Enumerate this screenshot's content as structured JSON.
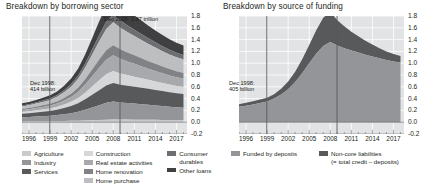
{
  "left": {
    "title": "Breakdown by borrowing sector",
    "annotations": [
      {
        "line1": "Dec 2008: 1.87 trillion",
        "line2": ""
      },
      {
        "line1": "Dec 1998:",
        "line2": "414 billion"
      }
    ],
    "legend": [
      {
        "label": "Agriculture",
        "color": "#c9cacb"
      },
      {
        "label": "Industry",
        "color": "#939598"
      },
      {
        "label": "Services",
        "color": "#58595b"
      },
      {
        "label": "Construction",
        "color": "#d6d7d8"
      },
      {
        "label": "Real estate activities",
        "color": "#a7a9ac"
      },
      {
        "label": "Home renovation",
        "color": "#808285"
      },
      {
        "label": "Home purchase",
        "color": "#bcbec0"
      },
      {
        "label": "Consumer",
        "sub": "durables",
        "color": "#6d6e71"
      },
      {
        "label": "Other loans",
        "color": "#404042"
      }
    ]
  },
  "right": {
    "title": "Breakdown by source of funding",
    "annotations": [
      {
        "line1": "Dec 1998:",
        "line2": "405 billion"
      }
    ],
    "legend": [
      {
        "label": "Funded by deposits",
        "color": "#939598"
      },
      {
        "label": "Non-core liabilities",
        "sub": "(= total credit – deposits)",
        "color": "#58595b"
      }
    ]
  },
  "axes": {
    "y_ticks": [
      "1.8",
      "1.6",
      "1.4",
      "1.2",
      "1.0",
      "0.8",
      "0.6",
      "0.4",
      "0.2",
      "0.0",
      "-0.2"
    ],
    "y_values": [
      1.8,
      1.6,
      1.4,
      1.2,
      1.0,
      0.8,
      0.6,
      0.4,
      0.2,
      0.0,
      -0.2
    ],
    "x_ticks": [
      "1996",
      "1999",
      "2002",
      "2005",
      "2008",
      "2011",
      "2014",
      "2017"
    ],
    "x_values": [
      1996,
      1999,
      2002,
      2005,
      2008,
      2011,
      2014,
      2017
    ],
    "ylim": [
      -0.2,
      1.8
    ],
    "xlim": [
      1995,
      2018.5
    ]
  },
  "chart_data": [
    {
      "type": "area",
      "title": "Breakdown by borrowing sector",
      "stacked": true,
      "xlabel": "",
      "ylabel": "",
      "ylim": [
        -0.2,
        1.8
      ],
      "xlim": [
        1995,
        2018.5
      ],
      "grid": true,
      "legend_position": "bottom",
      "units": "trillion",
      "annotations": [
        {
          "text": "Dec 2008: 1.87 trillion",
          "x": 2008.96,
          "y": 1.87
        },
        {
          "text": "Dec 1998: 414 billion",
          "x": 1998.96,
          "y": 0.414
        }
      ],
      "reference_lines": [
        {
          "x": 1998.96,
          "label": "Dec 1998"
        },
        {
          "x": 2008.96,
          "label": "Dec 2008"
        }
      ],
      "x": [
        1995,
        1996,
        1997,
        1998,
        1999,
        2000,
        2001,
        2002,
        2003,
        2004,
        2005,
        2006,
        2007,
        2008,
        2009,
        2010,
        2011,
        2012,
        2013,
        2014,
        2015,
        2016,
        2017,
        2018
      ],
      "series": [
        {
          "name": "Agriculture",
          "color": "#c9cacb",
          "values": [
            0.013,
            0.014,
            0.015,
            0.016,
            0.017,
            0.019,
            0.021,
            0.023,
            0.026,
            0.03,
            0.034,
            0.038,
            0.043,
            0.046,
            0.045,
            0.044,
            0.043,
            0.042,
            0.041,
            0.04,
            0.039,
            0.038,
            0.037,
            0.036
          ]
        },
        {
          "name": "Industry",
          "color": "#939598",
          "values": [
            0.07,
            0.074,
            0.08,
            0.086,
            0.092,
            0.102,
            0.115,
            0.13,
            0.15,
            0.18,
            0.215,
            0.25,
            0.285,
            0.305,
            0.29,
            0.28,
            0.272,
            0.264,
            0.255,
            0.245,
            0.235,
            0.225,
            0.215,
            0.208
          ]
        },
        {
          "name": "Services",
          "color": "#58595b",
          "values": [
            0.06,
            0.064,
            0.07,
            0.076,
            0.082,
            0.092,
            0.105,
            0.122,
            0.145,
            0.178,
            0.215,
            0.255,
            0.292,
            0.312,
            0.3,
            0.292,
            0.285,
            0.278,
            0.27,
            0.262,
            0.254,
            0.246,
            0.24,
            0.234
          ]
        },
        {
          "name": "Construction",
          "color": "#d6d7d8",
          "values": [
            0.03,
            0.032,
            0.035,
            0.038,
            0.042,
            0.048,
            0.058,
            0.07,
            0.088,
            0.112,
            0.14,
            0.168,
            0.192,
            0.205,
            0.192,
            0.182,
            0.172,
            0.162,
            0.152,
            0.144,
            0.136,
            0.128,
            0.122,
            0.118
          ]
        },
        {
          "name": "Real estate activities",
          "color": "#a7a9ac",
          "values": [
            0.032,
            0.035,
            0.039,
            0.043,
            0.048,
            0.056,
            0.068,
            0.084,
            0.107,
            0.138,
            0.176,
            0.214,
            0.248,
            0.266,
            0.248,
            0.232,
            0.218,
            0.204,
            0.19,
            0.178,
            0.166,
            0.156,
            0.148,
            0.142
          ]
        },
        {
          "name": "Home renovation",
          "color": "#808285",
          "values": [
            0.02,
            0.022,
            0.024,
            0.027,
            0.03,
            0.035,
            0.043,
            0.053,
            0.068,
            0.088,
            0.112,
            0.136,
            0.158,
            0.17,
            0.16,
            0.151,
            0.143,
            0.135,
            0.127,
            0.12,
            0.113,
            0.107,
            0.102,
            0.098
          ]
        },
        {
          "name": "Home purchase",
          "color": "#bcbec0",
          "values": [
            0.042,
            0.046,
            0.052,
            0.058,
            0.066,
            0.078,
            0.096,
            0.12,
            0.154,
            0.2,
            0.256,
            0.312,
            0.362,
            0.388,
            0.366,
            0.346,
            0.328,
            0.31,
            0.292,
            0.276,
            0.26,
            0.246,
            0.236,
            0.228
          ]
        },
        {
          "name": "Consumer durables",
          "color": "#6d6e71",
          "values": [
            0.018,
            0.019,
            0.021,
            0.023,
            0.026,
            0.03,
            0.036,
            0.044,
            0.055,
            0.07,
            0.088,
            0.106,
            0.122,
            0.13,
            0.122,
            0.115,
            0.108,
            0.102,
            0.096,
            0.09,
            0.085,
            0.08,
            0.076,
            0.073
          ]
        },
        {
          "name": "Other loans",
          "color": "#404042",
          "values": [
            0.035,
            0.038,
            0.042,
            0.047,
            0.053,
            0.062,
            0.076,
            0.094,
            0.119,
            0.152,
            0.192,
            0.232,
            0.268,
            0.288,
            0.27,
            0.254,
            0.24,
            0.226,
            0.212,
            0.2,
            0.189,
            0.179,
            0.171,
            0.165
          ]
        }
      ]
    },
    {
      "type": "area",
      "title": "Breakdown by source of funding",
      "stacked": true,
      "xlabel": "",
      "ylabel": "",
      "ylim": [
        -0.2,
        1.8
      ],
      "xlim": [
        1995,
        2018.5
      ],
      "grid": true,
      "legend_position": "bottom",
      "units": "trillion",
      "annotations": [
        {
          "text": "Dec 1998: 405 billion",
          "x": 1998.96,
          "y": 0.405
        }
      ],
      "reference_lines": [
        {
          "x": 1998.96,
          "label": "Dec 1998"
        },
        {
          "x": 2008.96,
          "label": "Dec 2008"
        }
      ],
      "x": [
        1995,
        1996,
        1997,
        1998,
        1999,
        2000,
        2001,
        2002,
        2003,
        2004,
        2005,
        2006,
        2007,
        2008,
        2009,
        2010,
        2011,
        2012,
        2013,
        2014,
        2015,
        2016,
        2017,
        2018
      ],
      "series": [
        {
          "name": "Funded by deposits",
          "color": "#939598",
          "values": [
            0.26,
            0.278,
            0.3,
            0.325,
            0.352,
            0.4,
            0.47,
            0.56,
            0.68,
            0.83,
            1.0,
            1.16,
            1.29,
            1.36,
            1.3,
            1.255,
            1.215,
            1.18,
            1.145,
            1.115,
            1.085,
            1.055,
            1.03,
            1.01
          ]
        },
        {
          "name": "Non-core liabilities",
          "color": "#58595b",
          "values": [
            0.045,
            0.05,
            0.055,
            0.06,
            0.062,
            0.075,
            0.098,
            0.13,
            0.175,
            0.235,
            0.31,
            0.4,
            0.48,
            0.51,
            0.43,
            0.37,
            0.32,
            0.275,
            0.235,
            0.2,
            0.17,
            0.145,
            0.125,
            0.11
          ]
        }
      ]
    }
  ]
}
